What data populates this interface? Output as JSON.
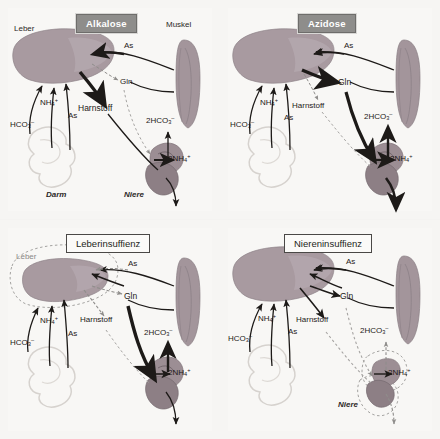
{
  "figure": {
    "caption_none": "",
    "background_color": "#f4f3f1"
  },
  "colors": {
    "liver_fill": "#a89aa0",
    "liver_fill_alt": "#b3a6ac",
    "muscle_fill": "#a3959b",
    "kidney_fill": "#9c8e94",
    "gut_stroke": "#d8d4d0",
    "arrow_dark": "#1d1a18",
    "arrow_faint": "#9b9997",
    "title_filled_bg": "#8e8d8b",
    "title_filled_text": "#ffffff",
    "title_outline_bg": "#fbfaf8",
    "title_outline_text": "#231f20"
  },
  "panels": [
    {
      "id": "alkalose",
      "title": "Alkalose",
      "title_style": "filled",
      "organs": {
        "liver": "Leber",
        "muscle": "Muskel",
        "gut": "Darm",
        "kidney": "Niere"
      },
      "metabolites": {
        "ammonium": "NH",
        "ammonium_sub": "4",
        "ammonium_sup": "+",
        "bicarbonate": "HCO",
        "bicarbonate_sub": "3",
        "bicarbonate_sup": "–",
        "amino_acids": "As",
        "glutamine": "Gln",
        "urea": "Harnstoff",
        "renal_bicarbonate": "2HCO",
        "renal_bicarbonate_sub": "3",
        "renal_bicarbonate_sup": "–",
        "renal_ammonium": "2NH",
        "renal_ammonium_sub": "4",
        "renal_ammonium_sup": "+"
      },
      "emphasis": "Urea synthesis pathway thick; glutamine pathway thin/dotted"
    },
    {
      "id": "azidose",
      "title": "Azidose",
      "title_style": "filled",
      "organs": {
        "liver": "",
        "muscle": "",
        "gut": "",
        "kidney": ""
      },
      "metabolites": {
        "ammonium": "NH",
        "ammonium_sub": "4",
        "ammonium_sup": "+",
        "bicarbonate": "HCO",
        "bicarbonate_sub": "3",
        "bicarbonate_sup": "–",
        "amino_acids": "As",
        "glutamine": "Gln",
        "urea": "Harnstoff",
        "renal_bicarbonate": "2HCO",
        "renal_bicarbonate_sub": "3",
        "renal_bicarbonate_sup": "–",
        "renal_ammonium": "2NH",
        "renal_ammonium_sub": "4",
        "renal_ammonium_sup": "+"
      },
      "emphasis": "Glutamine / renal pathway thick; urea pathway thin/dotted"
    },
    {
      "id": "leberinsuffizienz",
      "title": "Leberinsuffienz",
      "title_style": "outline",
      "organs": {
        "liver": "Leber",
        "muscle": "",
        "gut": "",
        "kidney": ""
      },
      "metabolites": {
        "ammonium": "NH",
        "ammonium_sub": "4",
        "ammonium_sup": "+",
        "bicarbonate": "HCO",
        "bicarbonate_sub": "3",
        "bicarbonate_sup": "–",
        "amino_acids": "As",
        "glutamine": "Gln",
        "urea": "Harnstoff",
        "renal_bicarbonate": "2HCO",
        "renal_bicarbonate_sub": "3",
        "renal_bicarbonate_sup": "–",
        "renal_ammonium": "2NH",
        "renal_ammonium_sub": "4",
        "renal_ammonium_sup": "+"
      },
      "emphasis": "Shrunken liver outlined; hepatic arrows dotted; renal pathway thick"
    },
    {
      "id": "niereninsuffizienz",
      "title": "Niereninsuffienz",
      "title_style": "outline",
      "organs": {
        "liver": "",
        "muscle": "",
        "gut": "",
        "kidney": "Niere"
      },
      "metabolites": {
        "ammonium": "NH",
        "ammonium_sub": "4",
        "ammonium_sup": "+",
        "bicarbonate": "HCO",
        "bicarbonate_sub": "3",
        "bicarbonate_sup": "–",
        "amino_acids": "As",
        "glutamine": "Gln",
        "urea": "Harnstoff",
        "renal_bicarbonate": "2HCO",
        "renal_bicarbonate_sub": "3",
        "renal_bicarbonate_sup": "–",
        "renal_ammonium": "2NH",
        "renal_ammonium_sub": "4",
        "renal_ammonium_sup": "+"
      },
      "emphasis": "Shrunken kidney outlined; renal arrows dotted; hepatic arrows solid"
    }
  ]
}
